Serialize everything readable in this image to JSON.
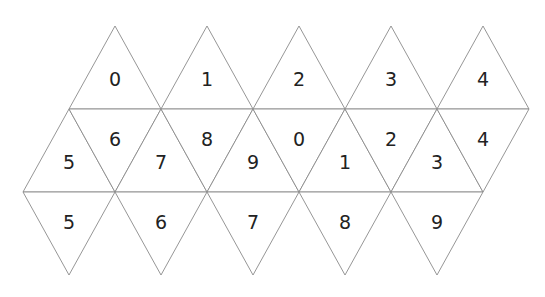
{
  "geometry": {
    "side": 92,
    "row_height": 83,
    "origin_x": 23,
    "top_y": 26
  },
  "rows": {
    "top": {
      "orientation": "up",
      "labels": [
        "0",
        "1",
        "2",
        "3",
        "4"
      ]
    },
    "middle": {
      "cells": [
        {
          "orientation": "up",
          "label": "5"
        },
        {
          "orientation": "down",
          "label": "6"
        },
        {
          "orientation": "up",
          "label": "7"
        },
        {
          "orientation": "down",
          "label": "8"
        },
        {
          "orientation": "up",
          "label": "9"
        },
        {
          "orientation": "down",
          "label": "0"
        },
        {
          "orientation": "up",
          "label": "1"
        },
        {
          "orientation": "down",
          "label": "2"
        },
        {
          "orientation": "up",
          "label": "3"
        },
        {
          "orientation": "down",
          "label": "4"
        }
      ]
    },
    "bottom": {
      "orientation": "down",
      "labels": [
        "5",
        "6",
        "7",
        "8",
        "9"
      ]
    }
  },
  "colors": {
    "stroke": "#8a8a8a",
    "text": "#222222",
    "background": "#ffffff"
  }
}
